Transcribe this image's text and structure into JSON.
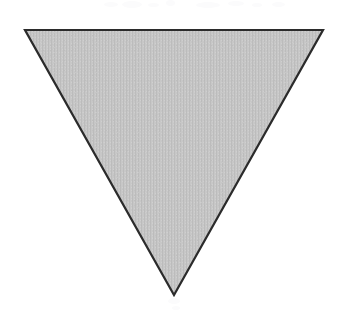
{
  "figure": {
    "canvas": {
      "width": 346,
      "height": 314,
      "background_color": "#ffffff"
    },
    "caption": "",
    "shape": {
      "name": "inverted-triangle",
      "type": "polygon",
      "description": "Downward-pointing isosceles triangle",
      "sides": 3,
      "orientation": "point-down",
      "vertices": [
        {
          "label": "top-left",
          "x": 25,
          "y": 30
        },
        {
          "label": "top-right",
          "x": 323,
          "y": 30
        },
        {
          "label": "bottom-apex",
          "x": 174,
          "y": 295
        }
      ],
      "points_attr": "25,30 323,30 174,295",
      "base_width": 298,
      "height": 265,
      "fill_color": "#c4c4c4",
      "fill_texture": "vertical-line-halftone",
      "stroke_color": "#2b2b2b",
      "stroke_width": 2.2
    },
    "artifacts": {
      "description": "faint scanner specks along the top margin",
      "color": "#fbfbfc",
      "specks": [
        {
          "x": 104,
          "y": 2,
          "w": 14,
          "h": 5
        },
        {
          "x": 122,
          "y": 1,
          "w": 20,
          "h": 7
        },
        {
          "x": 148,
          "y": 3,
          "w": 11,
          "h": 4
        },
        {
          "x": 166,
          "y": 0,
          "w": 9,
          "h": 6
        },
        {
          "x": 196,
          "y": 2,
          "w": 24,
          "h": 6
        },
        {
          "x": 228,
          "y": 1,
          "w": 16,
          "h": 5
        },
        {
          "x": 252,
          "y": 3,
          "w": 10,
          "h": 4
        },
        {
          "x": 272,
          "y": 2,
          "w": 13,
          "h": 5
        },
        {
          "x": 168,
          "y": 298,
          "w": 12,
          "h": 6
        },
        {
          "x": 172,
          "y": 306,
          "w": 8,
          "h": 4
        }
      ]
    }
  }
}
